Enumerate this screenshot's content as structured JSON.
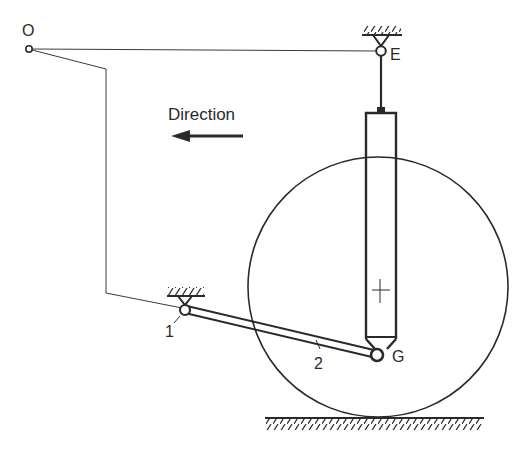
{
  "diagram": {
    "type": "mechanism-schematic",
    "labels": {
      "point_o": "O",
      "point_e": "E",
      "point_g": "G",
      "pivot_1": "1",
      "link_2": "2",
      "direction": "Direction"
    },
    "colors": {
      "stroke": "#2a2a2a",
      "background": "#ffffff"
    },
    "elements": [
      {
        "id": "O",
        "kind": "pivot-point",
        "x": 29,
        "y": 49
      },
      {
        "id": "E",
        "kind": "fixed-pivot",
        "x": 381,
        "y": 51
      },
      {
        "id": "1",
        "kind": "fixed-pivot",
        "x": 185,
        "y": 309
      },
      {
        "id": "G",
        "kind": "pivot-point",
        "x": 377,
        "y": 355
      },
      {
        "id": "wheel",
        "kind": "circle",
        "cx": 378,
        "cy": 287,
        "r": 130
      },
      {
        "id": "shock-absorber",
        "kind": "strut",
        "from": "E",
        "to": "G"
      },
      {
        "id": "link-2",
        "kind": "bar",
        "from": "1",
        "to": "G"
      },
      {
        "id": "ground",
        "kind": "hatched-surface",
        "y": 418
      }
    ],
    "direction_arrow": "left"
  }
}
